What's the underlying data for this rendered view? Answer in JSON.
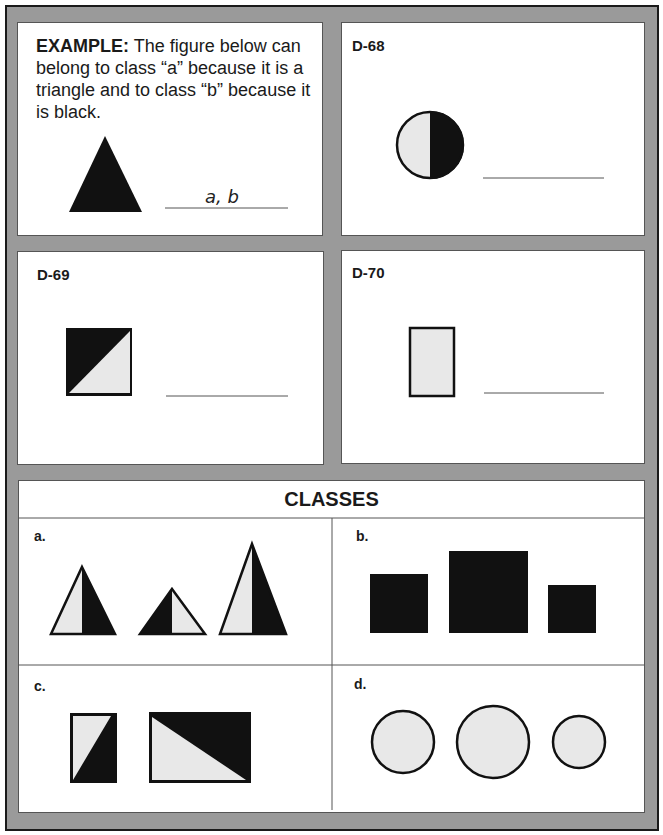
{
  "example": {
    "lead": "EXAMPLE:",
    "text": "The figure below can belong to class “a” because it is a triangle and to class “b” because it is black.",
    "answer": "a, b",
    "figure": "black-triangle"
  },
  "problems": [
    {
      "id": "D-68",
      "figure": "circle-half-light-half-black",
      "answer": ""
    },
    {
      "id": "D-69",
      "figure": "square-diagonal-black-top-left",
      "answer": ""
    },
    {
      "id": "D-70",
      "figure": "light-rectangle-outlined",
      "answer": ""
    }
  ],
  "classes": {
    "title": "CLASSES",
    "items": [
      {
        "label": "a.",
        "description": "three triangles each split vertically into light and black halves"
      },
      {
        "label": "b.",
        "description": "three black squares of different sizes"
      },
      {
        "label": "c.",
        "description": "two rectangles split diagonally into light and black"
      },
      {
        "label": "d.",
        "description": "three light circles with black outline of different sizes"
      }
    ]
  },
  "colors": {
    "frame": "#9a9a9a",
    "ink": "#111111",
    "light_fill": "#e8e8e8",
    "panel": "#ffffff"
  }
}
